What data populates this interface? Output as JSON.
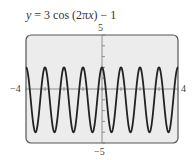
{
  "title": "y = 3 cos (2πx) − 1",
  "title_parts": {
    "y": "y",
    "eq": " = 3 cos (2π",
    "x": "x",
    "rest": ") − 1"
  },
  "axis_labels": {
    "ymax": "5",
    "ymin": "−5",
    "xmin": "−4",
    "xmax": "4"
  },
  "chart_data": {
    "type": "line",
    "title": "y = 3 cos (2πx) − 1",
    "function": "3*cos(2*pi*x) - 1",
    "xlabel": "",
    "ylabel": "",
    "xlim": [
      -4,
      4
    ],
    "ylim": [
      -5,
      5
    ],
    "x_ticks": [
      -4,
      -3,
      -2,
      -1,
      0,
      1,
      2,
      3,
      4
    ],
    "y_ticks": [
      -5,
      -4,
      -3,
      -2,
      -1,
      0,
      1,
      2,
      3,
      4,
      5
    ],
    "tick_labels": {
      "x": [
        "−4",
        "4"
      ],
      "y": [
        "−5",
        "5"
      ]
    },
    "max": 2,
    "min": -4,
    "period": 1,
    "grid": false,
    "legend": null
  }
}
